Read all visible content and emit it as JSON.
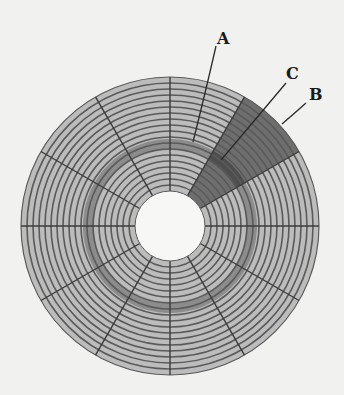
{
  "diagram": {
    "geometry": {
      "center_x": 170,
      "center_y": 226,
      "outer_radius": 149,
      "inner_radius": 35,
      "track_count": 19,
      "sector_count": 12,
      "highlighted_track_inner_radius": 76,
      "highlighted_track_outer_radius": 87,
      "highlighted_sector_start_deg": 30,
      "highlighted_sector_end_deg": 60
    },
    "colors": {
      "background": "#f1f1ef",
      "track_fill": "#bcbcbc",
      "track_line": "#5a5a5a",
      "sector_line": "#3c3c3c",
      "highlight_track": "#8c8c8c",
      "highlight_sector": "#6e6e6e",
      "highlight_sector_track": "#4e4e4e",
      "hole": "#f7f7f5",
      "leader_line": "#2a2a2a"
    },
    "labels": [
      {
        "id": "A",
        "text": "A",
        "meaning": "track",
        "x": 217,
        "y": 31,
        "line": [
          216,
          46,
          206,
          90,
          193,
          142
        ]
      },
      {
        "id": "B",
        "text": "B",
        "meaning": "sector",
        "x": 309,
        "y": 87,
        "line": [
          306,
          103,
          296,
          112,
          282,
          124
        ]
      },
      {
        "id": "C",
        "text": "C",
        "meaning": "track sector",
        "x": 286,
        "y": 66,
        "line": [
          286,
          83,
          255,
          120,
          221,
          160
        ]
      }
    ]
  }
}
